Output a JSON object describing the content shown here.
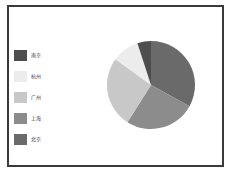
{
  "chart_data": {
    "type": "pie",
    "title": "",
    "categories": [
      "北京",
      "上海",
      "广州",
      "杭州",
      "南京"
    ],
    "values": [
      33,
      26,
      26,
      10,
      5
    ],
    "colors": [
      "#6a6a6a",
      "#8c8c8c",
      "#c8c8c8",
      "#ececec",
      "#4e4e4e"
    ],
    "start_angle": "12 o'clock, clockwise",
    "legend_position": "left",
    "legend": [
      {
        "label": "南京",
        "color": "#4e4e4e"
      },
      {
        "label": "杭州",
        "color": "#ececec"
      },
      {
        "label": "广州",
        "color": "#c8c8c8"
      },
      {
        "label": "上海",
        "color": "#8c8c8c"
      },
      {
        "label": "北京",
        "color": "#6a6a6a"
      }
    ]
  }
}
